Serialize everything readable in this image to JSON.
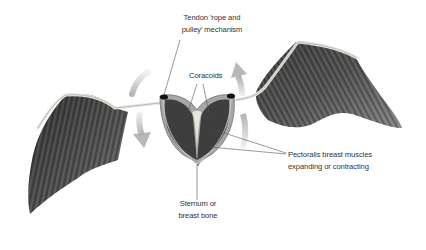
{
  "labels": {
    "tendon": {
      "line1": "Tendon 'rope and",
      "line2": "pulley' mechanism"
    },
    "coracoids": {
      "line1": "Coracoids"
    },
    "pectoralis": {
      "line1": "Pectoralis breast muscles",
      "line2": "expanding or contracting"
    },
    "sternum": {
      "line1": "Sternum or",
      "line2": "breast bone"
    }
  },
  "colors": {
    "feather_dark": "#3a3a3a",
    "feather_mid": "#5a5a5a",
    "bone": "#e8e8e0",
    "muscle_dark": "#404040",
    "muscle_light": "#9a9a9a",
    "arrow": "#c8c8c8",
    "leader_line": "#555555",
    "text": "#333333"
  },
  "arrows": [
    {
      "side": "left",
      "direction": "down"
    },
    {
      "side": "right",
      "direction": "up"
    }
  ]
}
